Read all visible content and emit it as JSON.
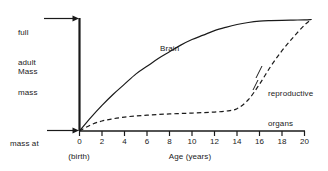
{
  "chart_data": {
    "type": "line",
    "title": "",
    "xlabel": "Age (years)",
    "ylabel": "Mass",
    "xlim": [
      0,
      20
    ],
    "ylim": [
      0,
      1
    ],
    "grid": false,
    "legend": "inline-annotations",
    "xticks": [
      "0",
      "2",
      "4",
      "6",
      "8",
      "10",
      "12",
      "14",
      "16",
      "18",
      "20"
    ],
    "xtick_values": [
      0,
      2,
      4,
      6,
      8,
      10,
      12,
      14,
      16,
      18,
      20
    ],
    "y_axis_annotations": [
      {
        "name": "full-adult-mass",
        "label": "full\nadult\nmass",
        "value": 1.0
      },
      {
        "name": "mass-at-birth",
        "label": "mass at\nbirth",
        "value": 0.0
      }
    ],
    "x_axis_annotations": [
      {
        "name": "birth",
        "label": "(birth)",
        "value": 0
      }
    ],
    "series": [
      {
        "name": "Brain",
        "style": "solid",
        "color": "#1a1a1a",
        "x": [
          0,
          1,
          2,
          3,
          4,
          5,
          6,
          7,
          8,
          9,
          10,
          11,
          12,
          13,
          14,
          15,
          16,
          17,
          18,
          19,
          20,
          20.6
        ],
        "values": [
          0.0,
          0.12,
          0.23,
          0.33,
          0.42,
          0.51,
          0.58,
          0.65,
          0.71,
          0.77,
          0.82,
          0.86,
          0.9,
          0.93,
          0.955,
          0.973,
          0.985,
          0.99,
          0.993,
          0.995,
          0.997,
          1.0
        ]
      },
      {
        "name": "reproductive organs",
        "style": "dashed",
        "color": "#1a1a1a",
        "x": [
          0,
          1,
          2,
          3,
          4,
          5,
          6,
          7,
          8,
          9,
          10,
          11,
          12,
          13,
          14,
          15,
          16,
          17,
          18,
          19,
          20,
          20.6
        ],
        "values": [
          0.0,
          0.055,
          0.09,
          0.11,
          0.125,
          0.135,
          0.142,
          0.148,
          0.153,
          0.157,
          0.161,
          0.165,
          0.17,
          0.178,
          0.2,
          0.28,
          0.42,
          0.58,
          0.72,
          0.84,
          0.95,
          1.0
        ]
      }
    ],
    "annotations": [
      {
        "name": "brain-label",
        "text": "Brain",
        "attached_to": "Brain"
      },
      {
        "name": "reproductive-organs-label",
        "text": "reproductive\norgans",
        "attached_to": "reproductive organs"
      }
    ]
  },
  "labels": {
    "full_adult_mass_line1": "full",
    "full_adult_mass_line2": "adult",
    "full_adult_mass_line3": "mass",
    "mass": "Mass",
    "mass_at_birth_line1": "mass at",
    "mass_at_birth_line2": "birth",
    "brain": "Brain",
    "reproductive_line1": "reproductive",
    "reproductive_line2": "organs",
    "birth": "(birth)",
    "age_axis": "Age (years)"
  },
  "ticks": {
    "x": [
      "0",
      "2",
      "4",
      "6",
      "8",
      "10",
      "12",
      "14",
      "16",
      "18",
      "20"
    ]
  },
  "colors": {
    "ink": "#1a1a1a",
    "background": "#ffffff"
  }
}
